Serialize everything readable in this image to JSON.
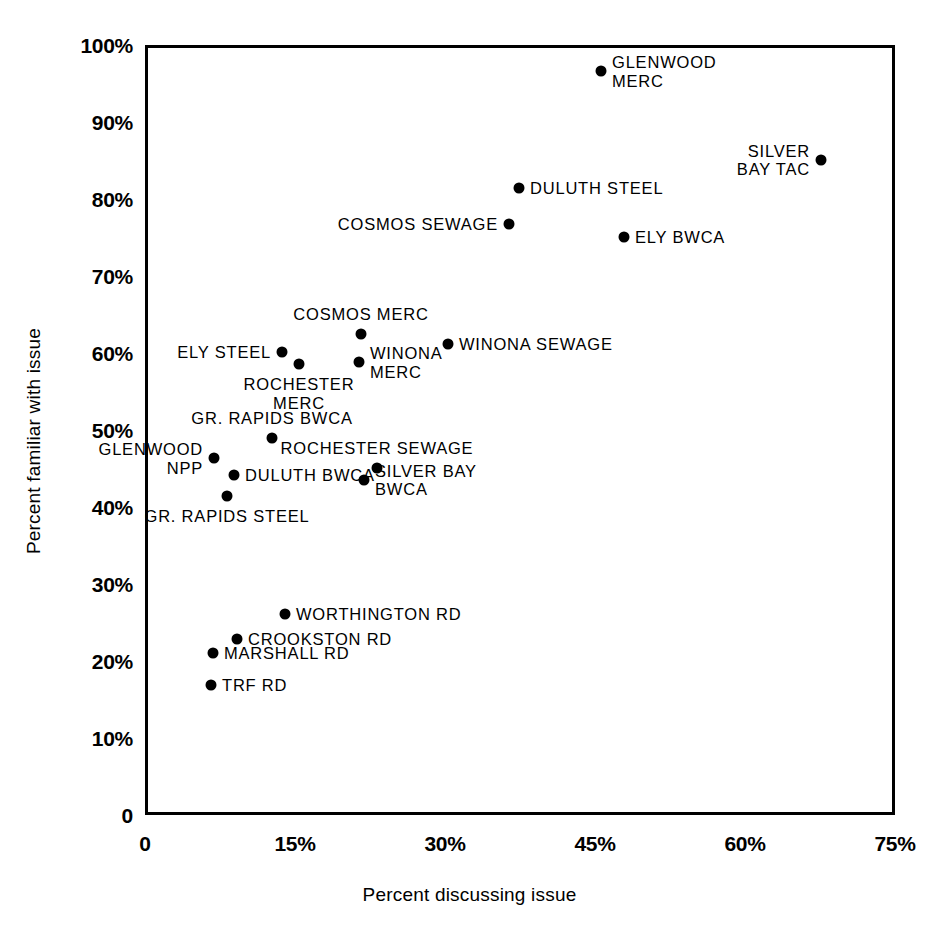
{
  "chart_data": {
    "type": "scatter",
    "title": "",
    "xlabel": "Percent discussing issue",
    "ylabel": "Percent familiar with issue",
    "xlim": [
      0,
      75
    ],
    "ylim": [
      0,
      100
    ],
    "grid": false,
    "legend": "none",
    "xticks": [
      "0",
      "15%",
      "30%",
      "45%",
      "60%",
      "75%"
    ],
    "xtick_values": [
      0,
      15,
      30,
      45,
      60,
      75
    ],
    "yticks": [
      "0",
      "10%",
      "20%",
      "30%",
      "40%",
      "50%",
      "60%",
      "70%",
      "80%",
      "90%",
      "100%"
    ],
    "ytick_values": [
      0,
      10,
      20,
      30,
      40,
      50,
      60,
      70,
      80,
      90,
      100
    ],
    "points": [
      {
        "label": "GLENWOOD\nMERC",
        "x": 45.3,
        "y": 97.0,
        "pos": "right"
      },
      {
        "label": "SILVER\nBAY TAC",
        "x": 67.3,
        "y": 85.5,
        "pos": "left"
      },
      {
        "label": "DULUTH STEEL",
        "x": 37.1,
        "y": 81.8,
        "pos": "right"
      },
      {
        "label": "COSMOS SEWAGE",
        "x": 36.1,
        "y": 77.2,
        "pos": "left"
      },
      {
        "label": "ELY BWCA",
        "x": 47.6,
        "y": 75.4,
        "pos": "right"
      },
      {
        "label": "COSMOS MERC",
        "x": 21.3,
        "y": 62.8,
        "pos": "above"
      },
      {
        "label": "WINONA SEWAGE",
        "x": 30.0,
        "y": 61.5,
        "pos": "right"
      },
      {
        "label": "ELY STEEL",
        "x": 13.4,
        "y": 60.5,
        "pos": "left"
      },
      {
        "label": "WINONA\nMERC",
        "x": 21.1,
        "y": 59.2,
        "pos": "right"
      },
      {
        "label": "ROCHESTER\nMERC",
        "x": 15.1,
        "y": 58.9,
        "pos": "below"
      },
      {
        "label": "GR. RAPIDS BWCA",
        "x": 12.4,
        "y": 49.3,
        "pos": "above"
      },
      {
        "label": "GLENWOOD\nNPP",
        "x": 6.6,
        "y": 46.7,
        "pos": "left"
      },
      {
        "label": "ROCHESTER SEWAGE",
        "x": 22.9,
        "y": 45.5,
        "pos": "above"
      },
      {
        "label": "DULUTH BWCA",
        "x": 8.6,
        "y": 44.6,
        "pos": "right"
      },
      {
        "label": "SILVER BAY\nBWCA",
        "x": 21.6,
        "y": 43.9,
        "pos": "right"
      },
      {
        "label": "GR. RAPIDS STEEL",
        "x": 7.9,
        "y": 41.8,
        "pos": "below"
      },
      {
        "label": "WORTHINGTON RD",
        "x": 13.7,
        "y": 26.5,
        "pos": "right"
      },
      {
        "label": "CROOKSTON RD",
        "x": 8.9,
        "y": 23.2,
        "pos": "right"
      },
      {
        "label": "MARSHALL RD",
        "x": 6.5,
        "y": 21.4,
        "pos": "right"
      },
      {
        "label": "TRF RD",
        "x": 6.3,
        "y": 17.3,
        "pos": "right"
      }
    ]
  },
  "colors": {
    "marker": "#000000",
    "axis": "#000000",
    "background": "#ffffff"
  }
}
